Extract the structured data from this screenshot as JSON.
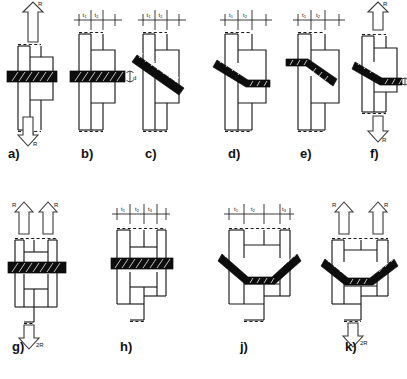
{
  "figure": {
    "background_color": "#ffffff",
    "line_color": "#1a1a1a",
    "fastener_color": "#0d0d0d",
    "arrow_fill": "#fdfdfd"
  },
  "labels": {
    "load_R": "R",
    "load_2R": "2R",
    "thickness_t1": "t",
    "thickness_t2": "t",
    "thickness_t3": "t",
    "sub_1": "1",
    "sub_2": "2",
    "sub_3": "3",
    "diameter_d": "d"
  },
  "panels": [
    {
      "id": "a",
      "label": "a)",
      "fastener": "straight-horizontal",
      "has_load_arrows": true,
      "arrow_up_label": "R",
      "arrow_down_label": "R",
      "has_dimension_row": false,
      "thickness_labels": [],
      "has_diameter_label": false
    },
    {
      "id": "b",
      "label": "b)",
      "fastener": "straight-horizontal",
      "has_load_arrows": false,
      "has_dimension_row": true,
      "thickness_labels": [
        "t1",
        "t2"
      ],
      "has_diameter_label": true,
      "diameter_label": "d"
    },
    {
      "id": "c",
      "label": "c)",
      "fastener": "inclined",
      "has_load_arrows": false,
      "has_dimension_row": true,
      "thickness_labels": [
        "t1",
        "t2"
      ],
      "has_diameter_label": false
    },
    {
      "id": "d",
      "label": "d)",
      "fastener": "bent-step-down",
      "has_load_arrows": false,
      "has_dimension_row": true,
      "thickness_labels": [
        "t1",
        "t2"
      ],
      "has_diameter_label": false
    },
    {
      "id": "e",
      "label": "e)",
      "fastener": "bent-step-down",
      "has_load_arrows": false,
      "has_dimension_row": true,
      "thickness_labels": [
        "t1",
        "t2"
      ],
      "has_diameter_label": false
    },
    {
      "id": "f",
      "label": "f)",
      "fastener": "bent-step-down",
      "has_load_arrows": true,
      "arrow_up_label": "R",
      "arrow_down_label": "R",
      "has_dimension_row": false,
      "thickness_labels": [],
      "has_diameter_label": true,
      "diameter_label": "d"
    },
    {
      "id": "g",
      "label": "g)",
      "fastener": "straight-horizontal-double",
      "has_load_arrows": true,
      "arrow_up_label": "R",
      "arrow_up_label_2": "R",
      "arrow_down_label": "2R",
      "double_up_arrows": true,
      "has_dimension_row": false,
      "thickness_labels": [],
      "has_diameter_label": false
    },
    {
      "id": "h",
      "label": "h)",
      "fastener": "straight-horizontal-double",
      "has_load_arrows": false,
      "has_dimension_row": true,
      "thickness_labels": [
        "t1",
        "t2",
        "t3"
      ],
      "has_diameter_label": false
    },
    {
      "id": "j",
      "label": "j)",
      "fastener": "vee-chevron",
      "has_load_arrows": false,
      "has_dimension_row": true,
      "thickness_labels": [
        "t1",
        "t2",
        "t3"
      ],
      "has_diameter_label": false
    },
    {
      "id": "k",
      "label": "k)",
      "fastener": "vee-chevron",
      "has_load_arrows": true,
      "arrow_up_label": "R",
      "arrow_up_label_2": "R",
      "arrow_down_label": "2R",
      "double_up_arrows": true,
      "has_dimension_row": false,
      "thickness_labels": [],
      "has_diameter_label": false
    }
  ]
}
